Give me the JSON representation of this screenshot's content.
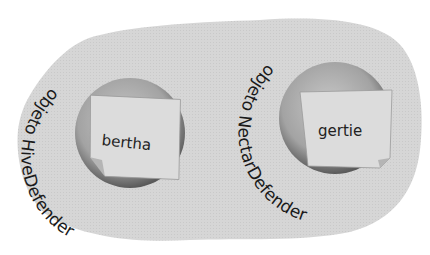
{
  "diagram": {
    "objects": [
      {
        "type_label": "objeto HiveDefender",
        "reference_name": "bertha"
      },
      {
        "type_label": "objeto NectarDefender",
        "reference_name": "gertie"
      }
    ],
    "colors": {
      "heap_blob": "#d4d4d4",
      "object_sphere": "#a8a8a8",
      "sticky_note": "#dcdcdc",
      "text": "#1a1a1a"
    }
  }
}
